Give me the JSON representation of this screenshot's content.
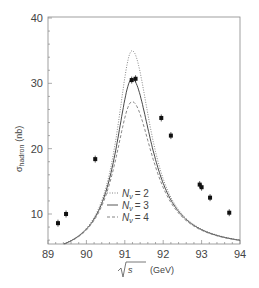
{
  "chart_data": {
    "type": "line",
    "title": "",
    "xlabel": "√s (GeV)",
    "ylabel": "σ_hadron (nb)",
    "xlim": [
      89,
      94
    ],
    "ylim": [
      5.2,
      40
    ],
    "x_ticks": [
      "89",
      "90",
      "91",
      "92",
      "93",
      "94"
    ],
    "y_ticks": [
      "10",
      "20",
      "30",
      "40"
    ],
    "grid": false,
    "legend_position": "center-left-lower",
    "series": [
      {
        "name": "N_ν = 2",
        "style": "dotted",
        "peak_x": 91.19,
        "peak_y": 35.0
      },
      {
        "name": "N_ν = 3",
        "style": "solid",
        "peak_x": 91.19,
        "peak_y": 30.7
      },
      {
        "name": "N_ν = 4",
        "style": "dashed",
        "peak_x": 91.19,
        "peak_y": 27.2
      }
    ],
    "measurements": {
      "x": [
        89.26,
        89.47,
        90.23,
        91.18,
        91.28,
        91.95,
        92.2,
        92.95,
        93.0,
        93.22,
        93.72
      ],
      "y": [
        8.6,
        10.0,
        18.4,
        30.5,
        30.7,
        24.7,
        22.0,
        14.5,
        14.1,
        12.5,
        10.2
      ]
    }
  },
  "labels": {
    "x_axis": "(GeV)",
    "x_axis_sqrt": "s",
    "y_axis_sigma": "σ",
    "y_axis_sub": "hadron",
    "y_axis_unit": "(nb)",
    "legend": [
      {
        "N": "N",
        "sub": "ν",
        "eq": "= 2"
      },
      {
        "N": "N",
        "sub": "ν",
        "eq": "= 3"
      },
      {
        "N": "N",
        "sub": "ν",
        "eq": "= 4"
      }
    ]
  }
}
